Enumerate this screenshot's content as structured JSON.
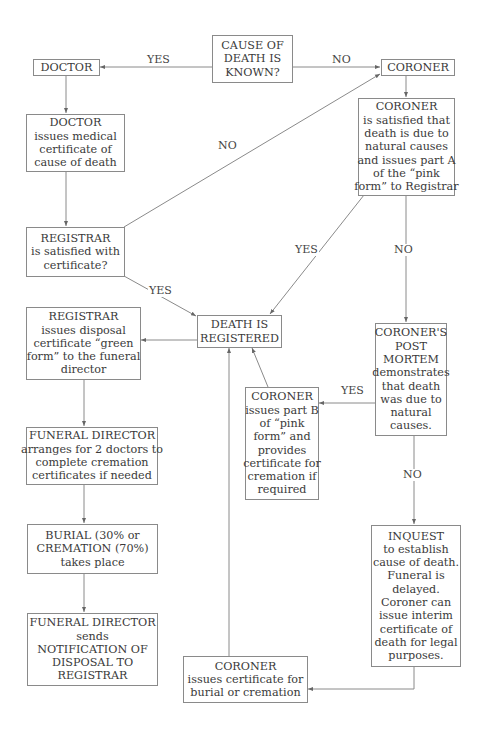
{
  "diagram": {
    "nodes": {
      "cause_known": {
        "lines": [
          "CAUSE OF",
          "DEATH IS",
          "KNOWN?"
        ]
      },
      "doctor": {
        "lines": [
          "DOCTOR"
        ]
      },
      "coroner": {
        "lines": [
          "CORONER"
        ]
      },
      "doctor_issues": {
        "lines": [
          "DOCTOR",
          "issues medical",
          "certificate of",
          "cause of death"
        ]
      },
      "coroner_satisfied": {
        "lines": [
          "CORONER",
          "is satisfied that",
          "death is due to",
          "natural causes",
          "and issues part A",
          "of the “pink",
          "form” to Registrar"
        ]
      },
      "registrar_satisfied": {
        "lines": [
          "REGISTRAR",
          "is satisfied with",
          "certificate?"
        ]
      },
      "death_registered": {
        "lines": [
          "DEATH IS",
          "REGISTERED"
        ]
      },
      "registrar_issues": {
        "lines": [
          "REGISTRAR",
          "issues disposal",
          "certificate “green",
          "form” to the funeral",
          "director"
        ]
      },
      "post_mortem": {
        "lines": [
          "CORONER'S",
          "POST",
          "MORTEM",
          "demonstrates",
          "that death",
          "was due to",
          "natural",
          "causes."
        ]
      },
      "coroner_part_b": {
        "lines": [
          "CORONER",
          "issues part B",
          "of “pink",
          "form” and",
          "provides",
          "certificate for",
          "cremation if",
          "required"
        ]
      },
      "funeral_arranges": {
        "lines": [
          "FUNERAL DIRECTOR",
          "arranges for 2 doctors to",
          "complete cremation",
          "certificates if needed"
        ]
      },
      "burial": {
        "lines": [
          "BURIAL (30% or",
          "CREMATION (70%)",
          "takes place"
        ]
      },
      "inquest": {
        "lines": [
          "INQUEST",
          "to establish",
          "cause of death.",
          "Funeral is",
          "delayed.",
          "Coroner can",
          "issue interim",
          "certificate of",
          "death for legal",
          "purposes."
        ]
      },
      "funeral_sends": {
        "lines": [
          "FUNERAL DIRECTOR",
          "sends",
          "NOTIFICATION OF",
          "DISPOSAL TO",
          "REGISTRAR"
        ]
      },
      "coroner_burial_cert": {
        "lines": [
          "CORONER",
          "issues certificate for",
          "burial or cremation"
        ]
      }
    },
    "edge_labels": {
      "yes_doctor": "YES",
      "no_coroner": "NO",
      "no_registrar_to_coroner": "NO",
      "yes_registrar_to_registered": "YES",
      "yes_coroner_to_registered": "YES",
      "no_coroner_to_postmortem": "NO",
      "yes_postmortem_to_partb": "YES",
      "no_postmortem_to_inquest": "NO"
    },
    "colors": {
      "line": "#8a8a8a",
      "text": "#3a3a3a"
    }
  }
}
